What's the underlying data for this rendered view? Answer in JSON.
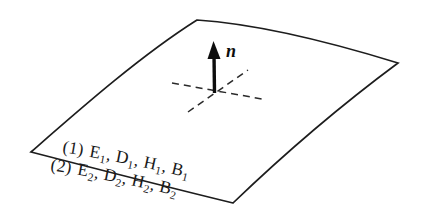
{
  "figure": {
    "background_color": "#ffffff",
    "ink_color": "#1a1a1a",
    "width": 422,
    "height": 223
  },
  "normal_vector": {
    "label": "n",
    "style": "bold-italic",
    "direction": "up",
    "tip": {
      "x": 213,
      "y": 43
    },
    "base": {
      "x": 215,
      "y": 93
    },
    "label_position": {
      "x": 226,
      "y": 56
    }
  },
  "tangent_lines": [
    {
      "name": "tangent-line-horizontal",
      "x1": 172,
      "y1": 83,
      "x2": 262,
      "y2": 99,
      "dash": "7 5"
    },
    {
      "name": "tangent-line-diagonal",
      "x1": 188,
      "y1": 112,
      "x2": 248,
      "y2": 70,
      "dash": "7 5"
    }
  ],
  "surface": {
    "name": "curved-boundary-surface",
    "corners": {
      "top": {
        "x": 197,
        "y": 20
      },
      "right": {
        "x": 398,
        "y": 63
      },
      "bottom": {
        "x": 233,
        "y": 203
      },
      "left": {
        "x": 31,
        "y": 152
      }
    },
    "path": "M 197 20 C 258 24, 330 42, 398 63 C 340 106, 282 156, 233 203 C 163 186, 93 168, 31 152 C 79 110, 140 56, 197 20 Z"
  },
  "media_labels": [
    {
      "name": "medium-one-label",
      "index": "(1)",
      "fields": "E₁, D₁, H₁, B₁",
      "full_text": "(1) E1, D1, H1, B1",
      "side": "above-boundary",
      "parts": [
        {
          "base": "(1)",
          "sub": ""
        },
        {
          "base": "E",
          "sub": "1"
        },
        {
          "base": ", D",
          "sub": "1"
        },
        {
          "base": ", H",
          "sub": "1"
        },
        {
          "base": ", B",
          "sub": "1"
        }
      ]
    },
    {
      "name": "medium-two-label",
      "index": "(2)",
      "fields": "E₂, D₂, H₂, B₂",
      "full_text": "(2) E2, D2, H2, B2",
      "side": "below-boundary",
      "parts": [
        {
          "base": "(2)",
          "sub": ""
        },
        {
          "base": "E",
          "sub": "2"
        },
        {
          "base": ", D",
          "sub": "2"
        },
        {
          "base": ", H",
          "sub": "2"
        },
        {
          "base": ", B",
          "sub": "2"
        }
      ]
    }
  ]
}
